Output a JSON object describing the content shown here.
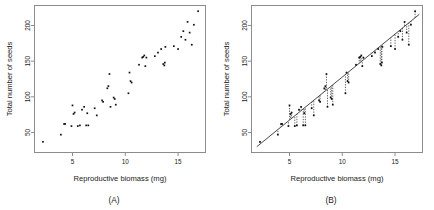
{
  "figure": {
    "panels": [
      {
        "id": "A",
        "caption": "(A)",
        "show_regression": false,
        "show_residuals": false
      },
      {
        "id": "B",
        "caption": "(B)",
        "show_regression": true,
        "show_residuals": true
      }
    ]
  },
  "chart_data": {
    "type": "scatter",
    "title": "",
    "xlabel": "Reproductive biomass (mg)",
    "ylabel": "Total number of seeds",
    "xlim": [
      1.4,
      17.6
    ],
    "ylim": [
      22,
      228
    ],
    "xticks": [
      5,
      10,
      15
    ],
    "yticks": [
      50,
      100,
      150,
      200
    ],
    "grid": false,
    "legend": "none",
    "regression": {
      "slope": 12.05,
      "intercept": 7.2,
      "x_start": 1.9,
      "x_end": 17.3
    },
    "x": [
      2.2,
      3.9,
      4.2,
      4.3,
      4.9,
      5.0,
      5.1,
      5.2,
      5.5,
      5.7,
      5.9,
      6.1,
      6.3,
      6.4,
      6.5,
      7.1,
      7.3,
      7.8,
      7.9,
      8.3,
      8.4,
      8.5,
      8.6,
      8.9,
      9.0,
      9.1,
      10.3,
      10.4,
      10.5,
      10.6,
      11.3,
      11.6,
      11.7,
      11.8,
      11.9,
      12.0,
      12.8,
      13.1,
      13.4,
      13.6,
      13.7,
      13.75,
      13.8,
      14.6,
      15.0,
      15.3,
      15.5,
      15.7,
      15.9,
      16.1,
      16.3,
      16.5,
      16.9
    ],
    "y": [
      37,
      47,
      62,
      62,
      59,
      88,
      76,
      78,
      59,
      60,
      82,
      86,
      60,
      77,
      60,
      84,
      74,
      95,
      93,
      112,
      115,
      132,
      86,
      99,
      97,
      89,
      105,
      134,
      122,
      120,
      145,
      155,
      156,
      158,
      143,
      155,
      157,
      162,
      167,
      146,
      144,
      148,
      170,
      171,
      167,
      184,
      192,
      180,
      205,
      190,
      173,
      201,
      220
    ],
    "point_count": 53,
    "units": {
      "x": "mg",
      "y": "seeds"
    }
  },
  "style": {
    "point_color": "#111111",
    "frame_color": "#8c8c8c",
    "regression_color": "#333333",
    "residual_color": "#3a3a3a",
    "background": "#ffffff"
  }
}
